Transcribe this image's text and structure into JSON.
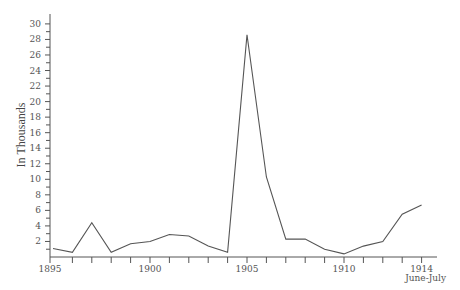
{
  "chart_data": {
    "type": "line",
    "title": "",
    "xlabel": "",
    "ylabel": "In Thousands",
    "x": [
      1895,
      1896,
      1897,
      1898,
      1899,
      1900,
      1901,
      1902,
      1903,
      1904,
      1905,
      1906,
      1907,
      1908,
      1909,
      1910,
      1911,
      1912,
      1913,
      1914
    ],
    "series": [
      {
        "name": "Value",
        "values": [
          1.1,
          0.6,
          4.4,
          0.6,
          1.7,
          2.0,
          2.9,
          2.7,
          1.4,
          0.6,
          28.6,
          10.3,
          2.3,
          2.3,
          1.0,
          0.4,
          1.4,
          2.0,
          5.5,
          6.7
        ]
      }
    ],
    "ylim": [
      0,
      31
    ],
    "xlim": [
      1895,
      1914.6
    ],
    "y_ticks": [
      2,
      4,
      6,
      8,
      10,
      12,
      14,
      16,
      18,
      20,
      22,
      24,
      26,
      28,
      30
    ],
    "y_minor_step": 1,
    "x_tick_labels": [
      {
        "value": 1895,
        "label": "1895"
      },
      {
        "value": 1900,
        "label": "1900"
      },
      {
        "value": 1905,
        "label": "1905"
      },
      {
        "value": 1910,
        "label": "1910"
      },
      {
        "value": 1914,
        "label": "1914",
        "sublabel": "June-July"
      }
    ],
    "grid": false,
    "legend": "none"
  }
}
